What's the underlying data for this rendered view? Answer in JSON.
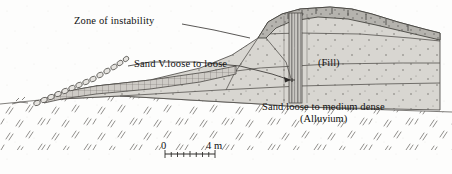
{
  "figure": {
    "kind": "geotechnical-cross-section",
    "title_visible": false,
    "width_px": 452,
    "height_px": 174
  },
  "labels": {
    "zone_of_instability": "Zone of instability",
    "sand_v_loose": "Sand V.loose to loose",
    "fill": "(Fill)",
    "alluvium_line1": "Sand loose to medium dense",
    "alluvium_line2": "(Alluvium)"
  },
  "scale_bar": {
    "start_label": "0",
    "end_label": "4 m",
    "units": "m",
    "min": 0,
    "max": 4,
    "minor_divisions": 8,
    "x_start_px": 165,
    "x_end_px": 215
  },
  "layers": [
    {
      "name": "crest-cap",
      "label": "",
      "fill_hex": "#b9b7b2"
    },
    {
      "name": "fill-body",
      "label": "(Fill)",
      "fill_hex": "#d8d6d1"
    },
    {
      "name": "sand-v-loose",
      "label": "Sand V.loose to loose",
      "fill_hex": "#d8d6d1"
    },
    {
      "name": "hatched-band",
      "label": "",
      "fill_hex": "#cfcdc8"
    },
    {
      "name": "alluvium",
      "label": "Sand loose to medium dense",
      "fill_hex": "#fdfdfc"
    }
  ],
  "features": {
    "vertical_column_x_px": 295,
    "riprap_block_chain": "oval-block-chain",
    "leader_lines": 2
  },
  "colors": {
    "ink": "#3a3a3a",
    "ink_dark": "#111111",
    "fill_light": "#d8d6d1",
    "fill_mid": "#c6c4bf",
    "fill_dark": "#b0aea9",
    "paper": "#fdfdfc"
  }
}
